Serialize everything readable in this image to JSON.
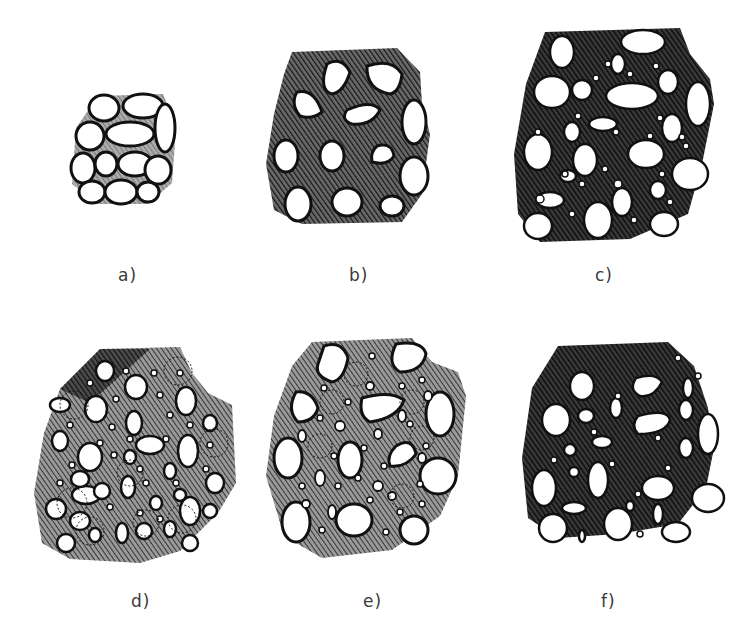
{
  "figure": {
    "panels": [
      {
        "id": "a",
        "label": "a)",
        "binder": "none",
        "hatch_density": "none",
        "coarse_count": 12,
        "fine_count": 0
      },
      {
        "id": "b",
        "label": "b)",
        "binder": "medium-dark hatched",
        "hatch_density": "medium",
        "coarse_count": 13,
        "fine_count": 0
      },
      {
        "id": "c",
        "label": "c)",
        "binder": "dark hatched",
        "hatch_density": "heavy",
        "coarse_count": 22,
        "fine_count": 20
      },
      {
        "id": "d",
        "label": "d)",
        "binder": "light hatched",
        "hatch_density": "light",
        "coarse_count": 30,
        "fine_count": 40
      },
      {
        "id": "e",
        "label": "e)",
        "binder": "light hatched",
        "hatch_density": "light",
        "coarse_count": 20,
        "fine_count": 35
      },
      {
        "id": "f",
        "label": "f)",
        "binder": "dark hatched",
        "hatch_density": "heavy",
        "coarse_count": 30,
        "fine_count": 10
      }
    ]
  },
  "colors": {
    "ink": "#111111",
    "paper": "#ffffff",
    "label": "#3a3a3a"
  }
}
